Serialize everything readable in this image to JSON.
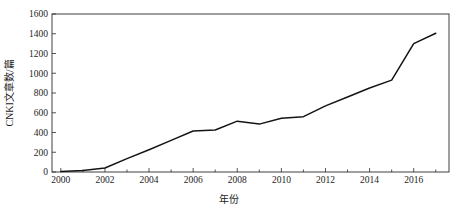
{
  "chart_data": {
    "type": "line",
    "title": "",
    "xlabel": "年份",
    "ylabel": "CNKI文章数/篇",
    "xlim": [
      1999.6,
      2017.6
    ],
    "ylim": [
      0,
      1600
    ],
    "grid": false,
    "legend": null,
    "x": [
      2000,
      2001,
      2002,
      2003,
      2004,
      2005,
      2006,
      2007,
      2008,
      2009,
      2010,
      2011,
      2012,
      2013,
      2014,
      2015,
      2016,
      2017
    ],
    "series": [
      {
        "name": "CNKI文章数",
        "values": [
          5,
          15,
          40,
          135,
          225,
          320,
          415,
          425,
          515,
          485,
          545,
          560,
          670,
          760,
          850,
          930,
          1300,
          1405
        ]
      }
    ],
    "x_tick_values": [
      2000,
      2002,
      2004,
      2006,
      2008,
      2010,
      2012,
      2014,
      2016
    ],
    "x_tick_labels": [
      "2000",
      "2002",
      "2004",
      "2006",
      "2008",
      "2010",
      "2012",
      "2014",
      "2016"
    ],
    "x_minor_ticks": [
      2001,
      2003,
      2005,
      2007,
      2009,
      2011,
      2013,
      2015,
      2017
    ],
    "y_tick_values": [
      0,
      200,
      400,
      600,
      800,
      1000,
      1200,
      1400,
      1600
    ],
    "y_tick_labels": [
      "0",
      "200",
      "400",
      "600",
      "800",
      "1000",
      "1200",
      "1400",
      "1600"
    ],
    "line_color": "#141414",
    "axis_color": "#2b2b2b",
    "background_color": "#ffffff"
  }
}
